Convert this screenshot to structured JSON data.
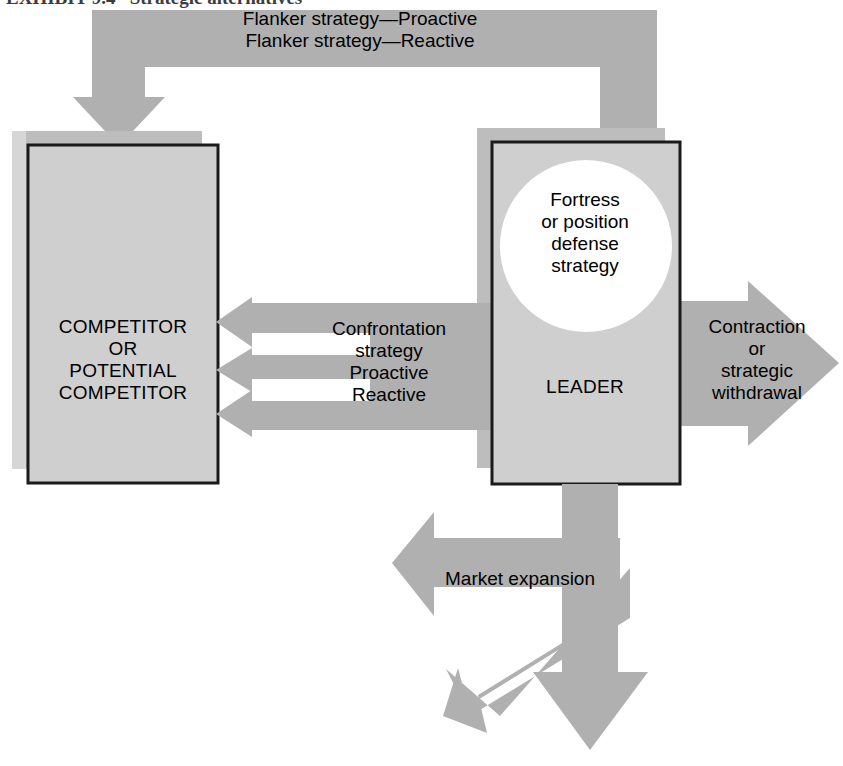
{
  "figure": {
    "caption": "EXHIBIT 9.4   Strategic alternatives",
    "background_color": "#ffffff",
    "arrow_color": "#b0b0b0",
    "box_fill_color": "#cfcfcf",
    "box_border_color": "#1a1a1a",
    "shadow_color": "#bdbdbd",
    "circle_color": "#ffffff",
    "text_color": "#000000"
  },
  "nodes": {
    "competitor_box": {
      "label": "COMPETITOR\nOR\nPOTENTIAL\nCOMPETITOR",
      "name": "competitor-or-potential-competitor"
    },
    "leader_box": {
      "label": "LEADER",
      "name": "leader"
    },
    "defense_circle": {
      "label": "Fortress\nor position\ndefense\nstrategy",
      "name": "fortress-or-position-defense-strategy"
    }
  },
  "arrows": {
    "flanker": {
      "label": "Flanker strategy—Proactive\nFlanker strategy—Reactive",
      "direction": "leader-to-competitor-overhead",
      "name": "flanker-strategy-arrow"
    },
    "confrontation": {
      "label": "Confrontation\nstrategy\nProactive\nReactive",
      "direction": "leader-to-competitor",
      "count": 3,
      "name": "confrontation-strategy-arrow"
    },
    "contraction": {
      "label": "Contraction\nor\nstrategic\nwithdrawal",
      "direction": "right",
      "name": "contraction-or-strategic-withdrawal-arrow"
    },
    "market_expansion": {
      "label": "Market expansion",
      "direction": "left",
      "name": "market-expansion-arrow"
    },
    "diagonal_expansion": {
      "label": "",
      "direction": "down-left",
      "name": "diagonal-expansion-arrow"
    },
    "downward_expansion": {
      "label": "",
      "direction": "down",
      "name": "downward-expansion-arrow"
    }
  }
}
